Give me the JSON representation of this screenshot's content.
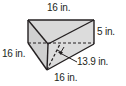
{
  "figure": {
    "type": "triangular prism",
    "fill_color": "#d9d9d9",
    "stroke_color": "#231f20",
    "labels": {
      "top_length": "16 in.",
      "right_height": "5 in.",
      "left_side": "16 in.",
      "triangle_height": "13.9 in.",
      "bottom_side": "16 in."
    }
  }
}
